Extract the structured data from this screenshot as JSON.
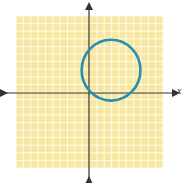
{
  "chart_data": {
    "type": "line",
    "title": "",
    "xlabel": "x",
    "ylabel": "",
    "xlim": [
      -10,
      10
    ],
    "ylim": [
      -10,
      10
    ],
    "grid": true,
    "grid_step": 1,
    "tick_labels": false,
    "series": [
      {
        "name": "circle",
        "shape": "circle",
        "center": [
          3,
          3
        ],
        "radius": 4,
        "equation": "(x-3)^2 + (y-3)^2 = 16",
        "color": "#2a8fae"
      }
    ],
    "colors": {
      "grid_background": "#f8e7a2",
      "grid_lines": "#fffbe8",
      "axes": "#333333",
      "curve": "#2a8fae"
    }
  },
  "axis_labels": {
    "x": "x"
  }
}
